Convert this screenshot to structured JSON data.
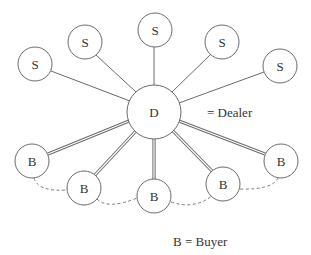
{
  "diagram": {
    "type": "network",
    "dealer": {
      "id": "D",
      "label": "D",
      "cx": 154,
      "cy": 112,
      "r": 27
    },
    "sellers": [
      {
        "id": "S1",
        "label": "S",
        "cx": 35,
        "cy": 64,
        "r": 17
      },
      {
        "id": "S2",
        "label": "S",
        "cx": 85,
        "cy": 42,
        "r": 17
      },
      {
        "id": "S3",
        "label": "S",
        "cx": 155,
        "cy": 30,
        "r": 17
      },
      {
        "id": "S4",
        "label": "S",
        "cx": 222,
        "cy": 42,
        "r": 17
      },
      {
        "id": "S5",
        "label": "S",
        "cx": 280,
        "cy": 66,
        "r": 17
      }
    ],
    "buyers": [
      {
        "id": "B1",
        "label": "B",
        "cx": 32,
        "cy": 161,
        "r": 17
      },
      {
        "id": "B2",
        "label": "B",
        "cx": 84,
        "cy": 188,
        "r": 17
      },
      {
        "id": "B3",
        "label": "B",
        "cx": 154,
        "cy": 196,
        "r": 17
      },
      {
        "id": "B4",
        "label": "B",
        "cx": 223,
        "cy": 184,
        "r": 17
      },
      {
        "id": "B5",
        "label": "B",
        "cx": 281,
        "cy": 161,
        "r": 17
      }
    ],
    "edges_seller_dealer": "single line",
    "edges_buyer_dealer": "double line",
    "edges_buyer_buyer": "dashed curve",
    "legend": {
      "dealer": "= Dealer",
      "buyer": "B = Buyer"
    }
  }
}
